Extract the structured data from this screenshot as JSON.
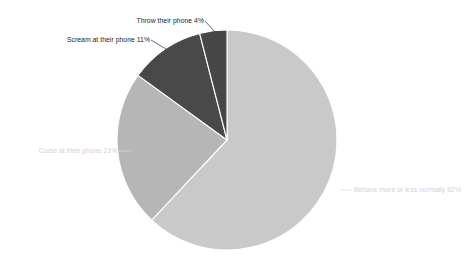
{
  "chart_data": {
    "type": "pie",
    "title": "",
    "subtitle": "",
    "xlabel": "",
    "ylabel": "",
    "legend_position": "none",
    "grid": false,
    "label_format": "{name} {value}%",
    "start_angle_deg": 0,
    "direction": "clockwise",
    "categories": [
      "Behave more or less normally",
      "Curse at their phone",
      "Scream at their phone",
      "Throw their phone"
    ],
    "values": [
      62,
      23,
      11,
      4
    ],
    "total": 100,
    "colors": [
      "#c9c9c9",
      "#b6b6b6",
      "#494949",
      "#474747"
    ],
    "slices": [
      {
        "name": "Behave more or less normally",
        "value": 62,
        "label": "Behave more or less normally 62%",
        "color": "#c9c9c9",
        "label_color": "#d2d2d2"
      },
      {
        "name": "Curse at their phone",
        "value": 23,
        "label": "Curse at their phone 23%",
        "color": "#b6b6b6",
        "label_color": "#d2d2d2"
      },
      {
        "name": "Scream at their phone",
        "value": 11,
        "label": "Scream at their phone 11%",
        "color": "#494949",
        "label_color": "#1d1d1d"
      },
      {
        "name": "Throw their phone",
        "value": 4,
        "label": "Throw their phone 4%",
        "color": "#474747",
        "label_color": "#1d1d1d"
      }
    ]
  },
  "canvas": {
    "background": "#ffffff",
    "center_x": 227,
    "center_y": 140,
    "radius": 110
  }
}
